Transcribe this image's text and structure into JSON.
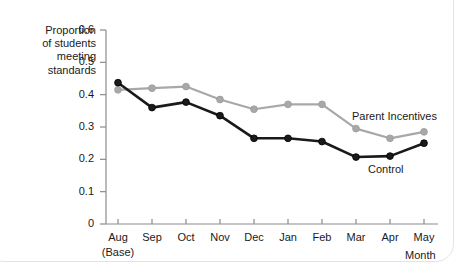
{
  "chart_data": {
    "type": "line",
    "title": "",
    "xlabel": "Month",
    "ylabel": "Proportion of students meeting standards",
    "ylabel_lines": [
      "Proportion",
      "of students",
      "meeting",
      "standards"
    ],
    "categories": [
      "Aug",
      "Sep",
      "Oct",
      "Nov",
      "Dec",
      "Jan",
      "Feb",
      "Mar",
      "Apr",
      "May"
    ],
    "category_sublabels": [
      "(Base)",
      "",
      "",
      "",
      "",
      "",
      "",
      "",
      "",
      ""
    ],
    "ylim": [
      0,
      0.6
    ],
    "yticks": [
      0,
      0.1,
      0.2,
      0.3,
      0.4,
      0.5,
      0.6
    ],
    "ytick_labels": [
      "0",
      "0.1",
      "0.2",
      "0.3",
      "0.4",
      "0.5",
      "0.6"
    ],
    "grid": false,
    "legend_position": "inline-annotation",
    "series": [
      {
        "name": "Parent Incentives",
        "color": "#a8a8a8",
        "values": [
          0.415,
          0.42,
          0.425,
          0.385,
          0.355,
          0.37,
          0.37,
          0.295,
          0.265,
          0.285
        ]
      },
      {
        "name": "Control",
        "color": "#1a1a1a",
        "values": [
          0.437,
          0.36,
          0.377,
          0.335,
          0.265,
          0.265,
          0.255,
          0.207,
          0.21,
          0.25
        ]
      }
    ],
    "annotations": [
      {
        "text": "Parent Incentives",
        "series": "Parent Incentives"
      },
      {
        "text": "Control",
        "series": "Control"
      }
    ]
  },
  "colors": {
    "parent_incentives": "#a8a8a8",
    "control": "#1a1a1a",
    "axis": "#8c8c8c",
    "frame": "#e3e3e3",
    "text": "#1a1a1a"
  }
}
